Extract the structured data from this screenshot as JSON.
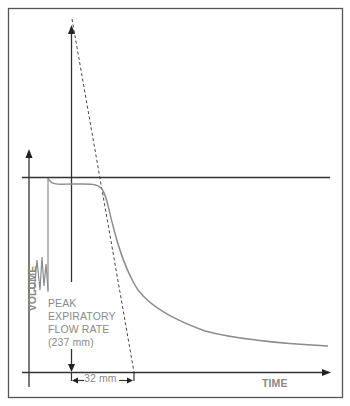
{
  "figure": {
    "type": "spirometry volume-time trace",
    "axes": {
      "y_label": "VOLUME",
      "x_label": "TIME"
    },
    "annotations": {
      "peak_lines": [
        "PEAK",
        "EXPIRATORY",
        "FLOW RATE",
        "(237 mm)"
      ],
      "interval": "32 mm"
    },
    "colors": {
      "frame": "#555555",
      "axes": "#333333",
      "curve": "#8c8c8c",
      "text": "#8a8a8a"
    }
  }
}
